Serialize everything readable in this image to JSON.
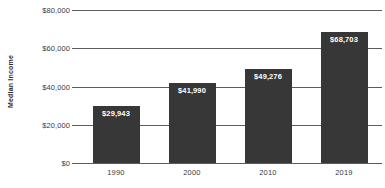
{
  "chart_data": {
    "type": "bar",
    "title": "",
    "subtitle": "",
    "xlabel": "",
    "ylabel": "Median Income",
    "categories": [
      "1990",
      "2000",
      "2010",
      "2019"
    ],
    "values": [
      29943,
      41990,
      49276,
      68703
    ],
    "data_labels": [
      "$29,943",
      "$41,990",
      "$49,276",
      "$68,703"
    ],
    "ylim": [
      0,
      80000
    ],
    "ytick_values": [
      80000,
      60000,
      40000,
      20000,
      0
    ],
    "ytick_labels": [
      "$80,000",
      "$60,000",
      "$40,000",
      "$20,000",
      "$0"
    ],
    "grid": true,
    "legend": false,
    "legend_position": "none",
    "colors": {
      "bar": "#373737",
      "gridline": "#5c5c5c",
      "data_label_text": "#ffffff",
      "tick_text": "#3a3a3a",
      "axis_title_text": "#2b2b2b",
      "background": "#ffffff"
    }
  }
}
